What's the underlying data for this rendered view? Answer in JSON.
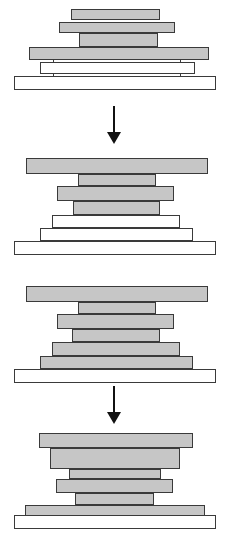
{
  "figure": {
    "title_fragment": "",
    "width": 230,
    "height": 533,
    "background": "#ffffff",
    "colors": {
      "gray_fill": "#c6c6c6",
      "white_fill": "#ffffff",
      "outline": "#3a3a3a",
      "arrow": "#111111"
    }
  },
  "stages": [
    {
      "id": "stage-1",
      "name": "stage-1",
      "top": 8,
      "bars": [
        {
          "name": "bar-1-1",
          "fill": "gray",
          "x": 71,
          "y": 9,
          "w": 89,
          "h": 11
        },
        {
          "name": "bar-1-2",
          "fill": "gray",
          "x": 59,
          "y": 22,
          "w": 116,
          "h": 11
        },
        {
          "name": "bar-1-3",
          "fill": "gray",
          "x": 79,
          "y": 33,
          "w": 79,
          "h": 14
        },
        {
          "name": "bar-1-4",
          "fill": "gray",
          "x": 29,
          "y": 47,
          "w": 180,
          "h": 13
        },
        {
          "name": "bar-1-5",
          "fill": "white",
          "x": 40,
          "y": 62,
          "w": 155,
          "h": 12
        },
        {
          "name": "bar-1-6",
          "fill": "white",
          "x": 14,
          "y": 76,
          "w": 202,
          "h": 14
        }
      ],
      "connectors": [
        {
          "name": "connector-1-left",
          "x": 53,
          "y": 60,
          "w": 1,
          "h": 16
        },
        {
          "name": "connector-1-right",
          "x": 180,
          "y": 60,
          "w": 1,
          "h": 16
        }
      ]
    },
    {
      "id": "stage-2",
      "name": "stage-2",
      "top": 155,
      "bars": [
        {
          "name": "bar-2-1",
          "fill": "gray",
          "x": 26,
          "y": 158,
          "w": 182,
          "h": 16
        },
        {
          "name": "bar-2-2",
          "fill": "gray",
          "x": 78,
          "y": 174,
          "w": 78,
          "h": 12
        },
        {
          "name": "bar-2-3",
          "fill": "gray",
          "x": 57,
          "y": 186,
          "w": 117,
          "h": 15
        },
        {
          "name": "bar-2-4",
          "fill": "gray",
          "x": 73,
          "y": 201,
          "w": 87,
          "h": 14
        },
        {
          "name": "bar-2-5",
          "fill": "white",
          "x": 52,
          "y": 215,
          "w": 128,
          "h": 13
        },
        {
          "name": "bar-2-6",
          "fill": "white",
          "x": 40,
          "y": 228,
          "w": 153,
          "h": 13
        },
        {
          "name": "bar-2-7",
          "fill": "white",
          "x": 14,
          "y": 241,
          "w": 202,
          "h": 14
        }
      ],
      "connectors": []
    },
    {
      "id": "stage-3",
      "name": "stage-3",
      "top": 280,
      "bars": [
        {
          "name": "bar-3-1",
          "fill": "gray",
          "x": 26,
          "y": 286,
          "w": 182,
          "h": 16
        },
        {
          "name": "bar-3-2",
          "fill": "gray",
          "x": 78,
          "y": 302,
          "w": 78,
          "h": 12
        },
        {
          "name": "bar-3-3",
          "fill": "gray",
          "x": 57,
          "y": 314,
          "w": 117,
          "h": 15
        },
        {
          "name": "bar-3-4",
          "fill": "gray",
          "x": 72,
          "y": 329,
          "w": 88,
          "h": 13
        },
        {
          "name": "bar-3-5",
          "fill": "gray",
          "x": 52,
          "y": 342,
          "w": 128,
          "h": 14
        },
        {
          "name": "bar-3-6",
          "fill": "gray",
          "x": 40,
          "y": 356,
          "w": 153,
          "h": 13
        },
        {
          "name": "bar-3-7",
          "fill": "white",
          "x": 14,
          "y": 369,
          "w": 202,
          "h": 14
        }
      ],
      "connectors": []
    },
    {
      "id": "stage-4",
      "name": "stage-4",
      "top": 425,
      "bars": [
        {
          "name": "bar-4-1",
          "fill": "gray",
          "x": 39,
          "y": 433,
          "w": 154,
          "h": 15
        },
        {
          "name": "bar-4-2",
          "fill": "gray",
          "x": 50,
          "y": 448,
          "w": 130,
          "h": 21
        },
        {
          "name": "bar-4-3",
          "fill": "gray",
          "x": 69,
          "y": 469,
          "w": 92,
          "h": 10
        },
        {
          "name": "bar-4-4",
          "fill": "gray",
          "x": 56,
          "y": 479,
          "w": 117,
          "h": 14
        },
        {
          "name": "bar-4-5",
          "fill": "gray",
          "x": 75,
          "y": 493,
          "w": 79,
          "h": 12
        },
        {
          "name": "bar-4-6",
          "fill": "gray",
          "x": 25,
          "y": 505,
          "w": 180,
          "h": 12
        },
        {
          "name": "bar-4-7",
          "fill": "white",
          "x": 14,
          "y": 515,
          "w": 202,
          "h": 14
        }
      ],
      "connectors": []
    }
  ],
  "arrows": [
    {
      "name": "arrow-stage1-to-stage2",
      "x": 105,
      "y": 106,
      "shaft_h": 26,
      "label": ""
    },
    {
      "name": "arrow-stage3-to-stage4",
      "x": 105,
      "y": 386,
      "shaft_h": 26,
      "label": ""
    }
  ]
}
